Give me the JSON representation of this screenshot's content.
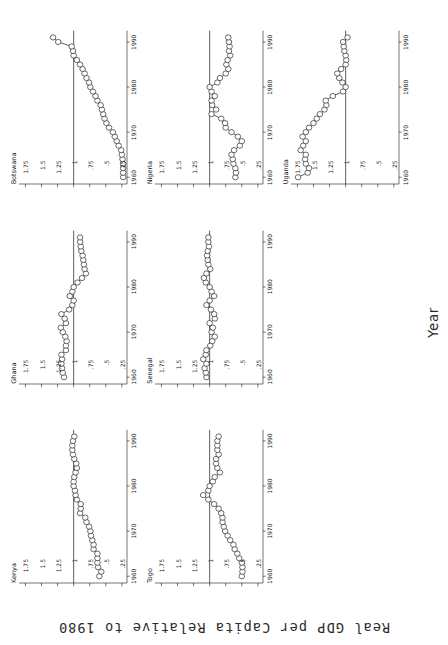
{
  "figure": {
    "ylabel": "Real GDP per Capita Relative to 1980",
    "xlabel": "Year"
  },
  "axes": {
    "yticks": [
      "1.75",
      "1.5",
      "1.25",
      "1",
      ".75",
      ".5",
      ".25"
    ],
    "ytick_values": [
      1.75,
      1.5,
      1.25,
      1,
      0.75,
      0.5,
      0.25
    ],
    "xticks": [
      "1960",
      "1970",
      "1980",
      "1990"
    ],
    "xtick_values": [
      1960,
      1970,
      1980,
      1990
    ],
    "ylim": [
      0.17,
      1.85
    ],
    "xlim": [
      1958.5,
      1992.5
    ],
    "reference_line": 1
  },
  "chart_data": {
    "type": "line",
    "title": "",
    "subtitle": "",
    "xlabel": "Year",
    "ylabel": "Real GDP per Capita Relative to 1980",
    "ylim": [
      0.17,
      1.85
    ],
    "xlim": [
      1958.5,
      1992.5
    ],
    "grid": false,
    "legend": "none",
    "marker": "open-circle",
    "annotations": [
      "Horizontal reference line drawn at y = 1 in every panel"
    ],
    "layout": {
      "rows": 3,
      "cols": 3,
      "panels_used": 7,
      "panels_empty": 2
    },
    "x": [
      1960,
      1961,
      1962,
      1963,
      1964,
      1965,
      1966,
      1967,
      1968,
      1969,
      1970,
      1971,
      1972,
      1973,
      1974,
      1975,
      1976,
      1977,
      1978,
      1979,
      1980,
      1981,
      1982,
      1983,
      1984,
      1985,
      1986,
      1987,
      1988,
      1989,
      1990,
      1991
    ],
    "series": [
      {
        "name": "Botswana",
        "values": [
          0.23,
          0.23,
          0.23,
          0.23,
          0.24,
          0.25,
          0.26,
          0.3,
          0.33,
          0.36,
          0.39,
          0.45,
          0.49,
          0.52,
          0.54,
          0.56,
          0.58,
          0.63,
          0.66,
          0.7,
          0.74,
          0.76,
          0.8,
          0.83,
          0.86,
          0.9,
          0.95,
          1.0,
          1.01,
          1.03,
          1.24,
          1.32
        ]
      },
      {
        "name": "Ghana",
        "values": [
          1.15,
          1.17,
          1.18,
          1.19,
          1.18,
          1.19,
          1.12,
          1.12,
          1.11,
          1.13,
          1.17,
          1.2,
          1.12,
          1.14,
          1.19,
          1.07,
          1.02,
          1.0,
          1.06,
          1.02,
          1.0,
          0.94,
          0.87,
          0.81,
          0.83,
          0.84,
          0.85,
          0.86,
          0.88,
          0.89,
          0.9,
          0.9
        ]
      },
      {
        "name": "Kenya",
        "values": [
          0.6,
          0.57,
          0.62,
          0.63,
          0.63,
          0.63,
          0.69,
          0.69,
          0.71,
          0.73,
          0.74,
          0.76,
          0.8,
          0.82,
          0.9,
          0.89,
          0.89,
          0.95,
          0.97,
          0.98,
          1.0,
          1.0,
          0.99,
          0.97,
          0.95,
          0.96,
          0.99,
          1.01,
          1.02,
          1.02,
          1.01,
          0.99
        ]
      },
      {
        "name": "Nigeria",
        "values": [
          0.6,
          0.59,
          0.6,
          0.63,
          0.64,
          0.66,
          0.62,
          0.53,
          0.5,
          0.56,
          0.66,
          0.75,
          0.76,
          0.82,
          0.97,
          0.9,
          0.96,
          0.97,
          0.92,
          0.97,
          1.0,
          0.88,
          0.84,
          0.75,
          0.71,
          0.74,
          0.72,
          0.68,
          0.7,
          0.69,
          0.7,
          0.71
        ]
      },
      {
        "name": "Senegal",
        "values": [
          1.05,
          1.06,
          1.08,
          1.05,
          1.1,
          1.06,
          1.05,
          0.99,
          0.96,
          0.92,
          0.97,
          0.95,
          1.0,
          0.92,
          0.93,
          0.98,
          1.05,
          1.0,
          0.93,
          0.97,
          1.0,
          1.06,
          1.09,
          1.05,
          0.99,
          1.02,
          1.03,
          1.04,
          1.03,
          1.01,
          1.02,
          1.02
        ]
      },
      {
        "name": "Togo",
        "values": [
          0.5,
          0.49,
          0.49,
          0.5,
          0.54,
          0.57,
          0.61,
          0.63,
          0.68,
          0.72,
          0.76,
          0.78,
          0.8,
          0.8,
          0.82,
          0.86,
          0.93,
          1.02,
          1.1,
          1.02,
          1.0,
          0.95,
          0.92,
          0.84,
          0.88,
          0.9,
          0.9,
          0.86,
          0.88,
          0.88,
          0.88,
          0.86
        ]
      },
      {
        "name": "Uganda",
        "values": [
          1.74,
          1.59,
          1.57,
          1.62,
          1.63,
          1.62,
          1.7,
          1.66,
          1.62,
          1.67,
          1.62,
          1.57,
          1.5,
          1.45,
          1.4,
          1.33,
          1.3,
          1.31,
          1.2,
          1.04,
          1.0,
          1.05,
          1.1,
          1.13,
          1.07,
          1.0,
          0.99,
          1.0,
          1.02,
          1.03,
          1.04,
          0.97
        ]
      }
    ]
  },
  "panels": [
    {
      "title": "Kenya",
      "series": "Kenya"
    },
    {
      "title": "Ghana",
      "series": "Ghana"
    },
    {
      "title": "Botswana",
      "series": "Botswana"
    },
    {
      "title": "Togo",
      "series": "Togo"
    },
    {
      "title": "Senegal",
      "series": "Senegal"
    },
    {
      "title": "Nigeria",
      "series": "Nigeria"
    },
    {
      "title": "",
      "series": ""
    },
    {
      "title": "",
      "series": ""
    },
    {
      "title": "Uganda",
      "series": "Uganda"
    }
  ]
}
